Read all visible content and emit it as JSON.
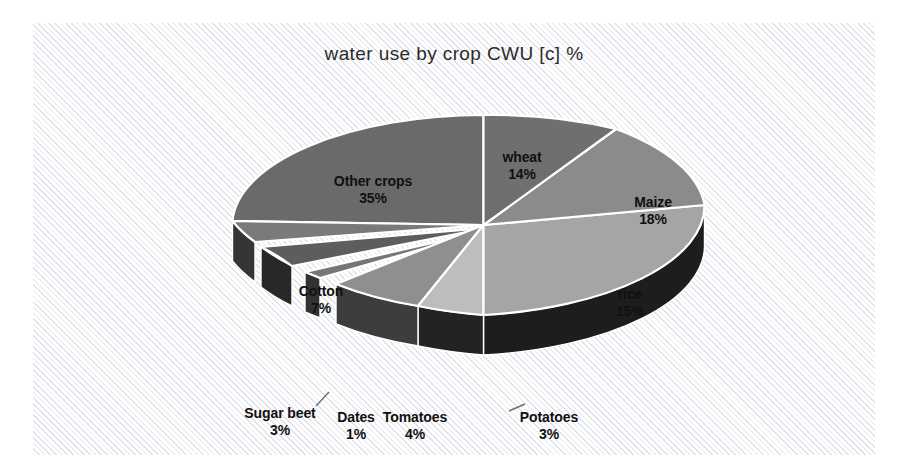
{
  "chart_data": {
    "type": "pie",
    "title": "water use by crop CWU [c] %",
    "xlabel": "",
    "ylabel": "",
    "unit": "%",
    "legend_position": "none",
    "grid": false,
    "three_d": true,
    "background": "#fcfcfd",
    "hatch_color": "#dfe2e8",
    "divider_color": "#ffffff",
    "categories": [
      "wheat",
      "Maize",
      "rice",
      "Potatoes",
      "Tomatoes",
      "Dates",
      "Sugar beet",
      "Cotton",
      "Other crops"
    ],
    "values": [
      14,
      18,
      15,
      3,
      4,
      1,
      3,
      7,
      35
    ],
    "slices": [
      {
        "name": "wheat",
        "percent": "14%",
        "value": 14,
        "top_color": "#6f6f6f",
        "side_color": "#3a3a3a",
        "label_x": 489,
        "label_y": 143,
        "exploded": false
      },
      {
        "name": "Maize",
        "percent": "18%",
        "value": 18,
        "top_color": "#8b8b8b",
        "side_color": "#4a4a4a",
        "label_x": 620,
        "label_y": 188,
        "exploded": false
      },
      {
        "name": "rice",
        "percent": "15%",
        "value": 15,
        "top_color": "#a5a5a5",
        "side_color": "#1d1d1d",
        "label_x": 597,
        "label_y": 280,
        "exploded": false
      },
      {
        "name": "Potatoes",
        "percent": "3%",
        "value": 3,
        "top_color": "#bdbdbd",
        "side_color": "#232323",
        "label_x": 516,
        "label_y": 403,
        "exploded": false
      },
      {
        "name": "Tomatoes",
        "percent": "4%",
        "value": 4,
        "top_color": "#8f8f8f",
        "side_color": "#3d3d3d",
        "label_x": 382,
        "label_y": 403,
        "exploded": false
      },
      {
        "name": "Dates",
        "percent": "1%",
        "value": 1,
        "top_color": "#767676",
        "side_color": "#323232",
        "label_x": 323,
        "label_y": 403,
        "exploded": true
      },
      {
        "name": "Sugar beet",
        "percent": "3%",
        "value": 3,
        "top_color": "#5d5d5d",
        "side_color": "#282828",
        "label_x": 247,
        "label_y": 399,
        "exploded": true
      },
      {
        "name": "Cotton",
        "percent": "7%",
        "value": 7,
        "top_color": "#7a7a7a",
        "side_color": "#353535",
        "label_x": 288,
        "label_y": 277,
        "exploded": false
      },
      {
        "name": "Other crops",
        "percent": "35%",
        "value": 35,
        "top_color": "#6a6a6a",
        "side_color": "#2e2e2e",
        "label_x": 340,
        "label_y": 167,
        "exploded": false
      }
    ]
  }
}
